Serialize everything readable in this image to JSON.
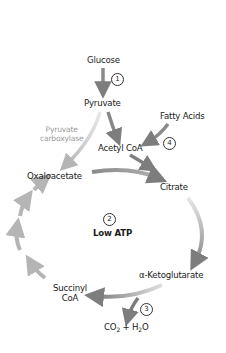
{
  "diagram": {
    "nodes": {
      "glucose": "Glucose",
      "pyruvate": "Pyruvate",
      "fatty_acids": "Fatty Acids",
      "acetyl_coa": "Acetyl CoA",
      "pyruvate_carboxylase_1": "Pyruvate",
      "pyruvate_carboxylase_2": "carboxylase",
      "oxaloacetate": "Oxaloacetate",
      "citrate": "Citrate",
      "alpha_ketoglutarate": "α-Ketoglutarate",
      "succinyl_1": "Succinyl",
      "succinyl_2": "CoA",
      "co2": "CO",
      "co2_sub": "2",
      "plus_h2": " + H",
      "h2o_sub": "2",
      "o": "O",
      "center_label": "Low ATP"
    },
    "step_numbers": {
      "step1": "1",
      "step2": "2",
      "step3": "3",
      "step4": "4"
    },
    "colors": {
      "arrow_dark": "#7a7a7a",
      "arrow_light": "#c8c8c8",
      "text": "#1a1a1a",
      "enzyme_text": "#9a9a9a"
    }
  }
}
